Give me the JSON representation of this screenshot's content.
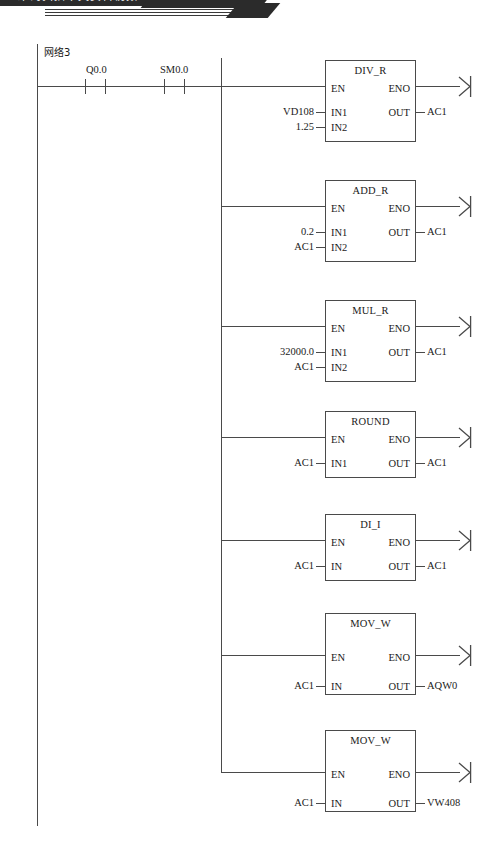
{
  "banner": {
    "text": "二维码扫描中文资料视频",
    "note": "cropped decorative book header strip"
  },
  "network": {
    "label": "网络3",
    "contacts": [
      {
        "name": "Q0.0",
        "type": "normally-open-contact"
      },
      {
        "name": "SM0.0",
        "type": "normally-open-contact"
      }
    ]
  },
  "blocks": [
    {
      "name": "DIV_R",
      "enable_in": "EN",
      "enable_out": "ENO",
      "inputs": [
        {
          "pin": "IN1",
          "operand": "VD108"
        },
        {
          "pin": "IN2",
          "operand": "1.25"
        }
      ],
      "outputs": [
        {
          "pin": "OUT",
          "operand": "AC1"
        }
      ]
    },
    {
      "name": "ADD_R",
      "enable_in": "EN",
      "enable_out": "ENO",
      "inputs": [
        {
          "pin": "IN1",
          "operand": "0.2"
        },
        {
          "pin": "IN2",
          "operand": "AC1"
        }
      ],
      "outputs": [
        {
          "pin": "OUT",
          "operand": "AC1"
        }
      ]
    },
    {
      "name": "MUL_R",
      "enable_in": "EN",
      "enable_out": "ENO",
      "inputs": [
        {
          "pin": "IN1",
          "operand": "32000.0"
        },
        {
          "pin": "IN2",
          "operand": "AC1"
        }
      ],
      "outputs": [
        {
          "pin": "OUT",
          "operand": "AC1"
        }
      ]
    },
    {
      "name": "ROUND",
      "enable_in": "EN",
      "enable_out": "ENO",
      "inputs": [
        {
          "pin": "IN1",
          "operand": "AC1"
        }
      ],
      "outputs": [
        {
          "pin": "OUT",
          "operand": "AC1"
        }
      ]
    },
    {
      "name": "DI_I",
      "enable_in": "EN",
      "enable_out": "ENO",
      "inputs": [
        {
          "pin": "IN",
          "operand": "AC1"
        }
      ],
      "outputs": [
        {
          "pin": "OUT",
          "operand": "AC1"
        }
      ]
    },
    {
      "name": "MOV_W",
      "enable_in": "EN",
      "enable_out": "ENO",
      "inputs": [
        {
          "pin": "IN",
          "operand": "AC1"
        }
      ],
      "outputs": [
        {
          "pin": "OUT",
          "operand": "AQW0"
        }
      ]
    },
    {
      "name": "MOV_W",
      "enable_in": "EN",
      "enable_out": "ENO",
      "inputs": [
        {
          "pin": "IN",
          "operand": "AC1"
        }
      ],
      "outputs": [
        {
          "pin": "OUT",
          "operand": "VW408"
        }
      ]
    }
  ],
  "colors": {
    "line": "#4a4a4a",
    "text": "#1a1a1a",
    "banner": "#2b2b2b",
    "background": "#ffffff"
  }
}
